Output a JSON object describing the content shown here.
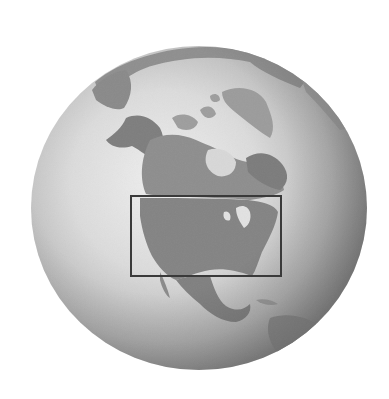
{
  "image": {
    "subject": "Grayscale globe centered on North America",
    "width": 389,
    "height": 399,
    "background": "#ffffff"
  },
  "globe": {
    "cx": 199,
    "cy": 208,
    "r": 165,
    "ocean_light": "#eeeeee",
    "ocean_mid": "#c9c9c9",
    "ocean_dark": "#8a8a8a",
    "land_color": "#8c8c8c",
    "land_dark": "#707070",
    "ice_color": "#e4e4e4"
  },
  "highlight_box": {
    "label": "Contiguous United States",
    "x": 131,
    "y": 196,
    "width": 150,
    "height": 80,
    "stroke": "#3a3a3a",
    "stroke_width": 2
  }
}
